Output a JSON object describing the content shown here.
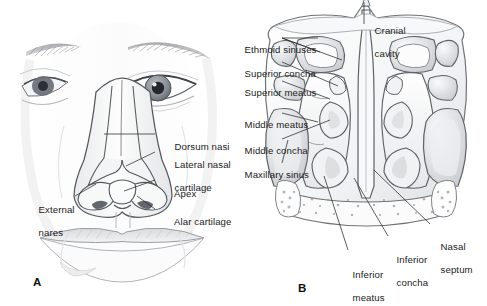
{
  "figure": {
    "background_color": "#ffffff",
    "text_color": "#1b1b1b",
    "leader_line_color": "#2a2a2a",
    "width": 487,
    "height": 306
  },
  "panel_a": {
    "letter": "A",
    "caption": "Anterior view of the external nose and face",
    "labels": [
      {
        "id": "dorsum-nasi",
        "text": "Dorsum nasi",
        "lines": [
          "Dorsum nasi"
        ],
        "x": 158,
        "y": 130
      },
      {
        "id": "lateral-nasal-cartilage",
        "text": "Lateral nasal cartilage",
        "lines": [
          "Lateral nasal",
          "cartilage"
        ],
        "x": 158,
        "y": 148
      },
      {
        "id": "apex",
        "text": "Apex",
        "lines": [
          "Apex"
        ],
        "x": 158,
        "y": 177
      },
      {
        "id": "alar-cartilage",
        "text": "Alar cartilage",
        "lines": [
          "Alar cartilage"
        ],
        "x": 158,
        "y": 205
      },
      {
        "id": "external-nares",
        "text": "External nares",
        "lines": [
          "External",
          "nares"
        ],
        "x": 22,
        "y": 193
      }
    ]
  },
  "panel_b": {
    "letter": "B",
    "caption": "Coronal section through the nasal cavity and paranasal sinuses",
    "labels_left": [
      {
        "id": "ethmoid-sinuses",
        "text": "Ethmoid sinuses",
        "lines": [
          "Ethmoid sinuses"
        ],
        "x": 228,
        "y": 33
      },
      {
        "id": "superior-concha",
        "text": "Superior concha",
        "lines": [
          "Superior concha"
        ],
        "x": 228,
        "y": 57
      },
      {
        "id": "superior-meatus",
        "text": "Superior meatus",
        "lines": [
          "Superior meatus"
        ],
        "x": 228,
        "y": 76
      },
      {
        "id": "middle-meatus",
        "text": "Middle meatus",
        "lines": [
          "Middle meatus"
        ],
        "x": 228,
        "y": 108
      },
      {
        "id": "middle-concha",
        "text": "Middle concha",
        "lines": [
          "Middle concha"
        ],
        "x": 228,
        "y": 134
      },
      {
        "id": "maxillary-sinus",
        "text": "Maxillary sinus",
        "lines": [
          "Maxillary sinus"
        ],
        "x": 228,
        "y": 158
      }
    ],
    "labels_top": [
      {
        "id": "cranial-cavity",
        "text": "Cranial cavity",
        "lines": [
          "Cranial",
          "cavity"
        ],
        "x": 358,
        "y": 14
      }
    ],
    "labels_bottom": [
      {
        "id": "inferior-meatus",
        "text": "Inferior meatus",
        "lines": [
          "Inferior",
          "meatus"
        ],
        "x": 336,
        "y": 258
      },
      {
        "id": "inferior-concha",
        "text": "Inferior concha",
        "lines": [
          "Inferior",
          "concha"
        ],
        "x": 380,
        "y": 243
      },
      {
        "id": "nasal-septum",
        "text": "Nasal septum",
        "lines": [
          "Nasal",
          "septum"
        ],
        "x": 424,
        "y": 230
      }
    ]
  }
}
